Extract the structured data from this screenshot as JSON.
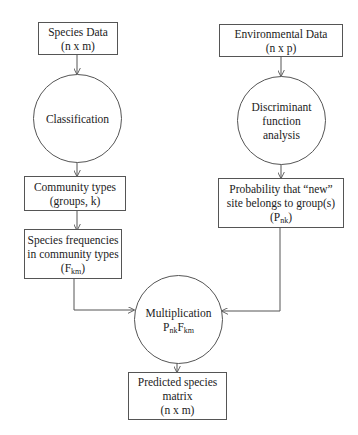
{
  "diagram": {
    "type": "flowchart",
    "nodes": [
      {
        "id": "species_data",
        "shape": "rect",
        "lines": [
          "Species Data",
          "(n x m)"
        ]
      },
      {
        "id": "classification",
        "shape": "circle",
        "lines": [
          "Classification"
        ]
      },
      {
        "id": "community_types",
        "shape": "rect",
        "lines": [
          "Community types",
          "(groups, k)"
        ]
      },
      {
        "id": "species_freq",
        "shape": "rect",
        "lines": [
          "Species frequencies",
          "in community types"
        ],
        "formula": {
          "base": "(F",
          "sub": "km",
          "tail": ")"
        }
      },
      {
        "id": "environmental_data",
        "shape": "rect",
        "lines": [
          "Environmental Data",
          "(n x p)"
        ]
      },
      {
        "id": "discriminant",
        "shape": "circle",
        "lines": [
          "Discriminant",
          "function",
          "analysis"
        ]
      },
      {
        "id": "probability",
        "shape": "rect",
        "lines": [
          "Probability that “new”",
          "site belongs to group(s)"
        ],
        "formula": {
          "base": "(P",
          "sub": "nk",
          "tail": ")"
        }
      },
      {
        "id": "multiplication",
        "shape": "circle",
        "lines": [
          "Multiplication"
        ],
        "formula": {
          "p": "P",
          "p_sub": "nk",
          "f": "F",
          "f_sub": "km"
        }
      },
      {
        "id": "predicted",
        "shape": "rect",
        "lines": [
          "Predicted species",
          "matrix",
          "(n x m)"
        ]
      }
    ],
    "edges": [
      {
        "from": "species_data",
        "to": "classification"
      },
      {
        "from": "classification",
        "to": "community_types"
      },
      {
        "from": "community_types",
        "to": "species_freq"
      },
      {
        "from": "species_freq",
        "to": "multiplication"
      },
      {
        "from": "environmental_data",
        "to": "discriminant"
      },
      {
        "from": "discriminant",
        "to": "probability"
      },
      {
        "from": "probability",
        "to": "multiplication"
      },
      {
        "from": "multiplication",
        "to": "predicted"
      }
    ]
  },
  "colors": {
    "stroke": "#555555",
    "text": "#222222",
    "background": "#ffffff"
  }
}
